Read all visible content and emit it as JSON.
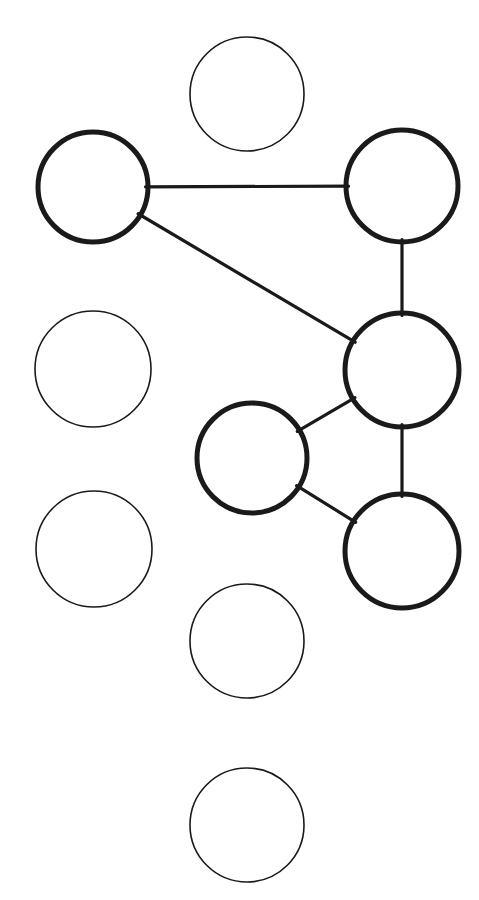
{
  "canvas": {
    "width": 479,
    "height": 900,
    "background_color": "#ffffff",
    "title": "Node Graph Diagram"
  },
  "style": {
    "node_stroke_color": "#1a1a1a",
    "node_fill_color": "#ffffff",
    "edge_stroke_color": "#1a1a1a",
    "selected_stroke_width": 5,
    "unselected_stroke_width": 1.6,
    "edge_stroke_width": 3.2
  },
  "nodes": [
    {
      "id": "n1",
      "label": "",
      "cx": 247,
      "cy": 94,
      "r": 57,
      "state": "unselected",
      "name": "node-top-center"
    },
    {
      "id": "n2",
      "label": "",
      "cx": 93,
      "cy": 187,
      "r": 55,
      "state": "selected",
      "name": "node-upper-left"
    },
    {
      "id": "n3",
      "label": "",
      "cx": 402,
      "cy": 186,
      "r": 56,
      "state": "selected",
      "name": "node-upper-right"
    },
    {
      "id": "n4",
      "label": "",
      "cx": 93,
      "cy": 369,
      "r": 58,
      "state": "unselected",
      "name": "node-mid-left"
    },
    {
      "id": "n5",
      "label": "",
      "cx": 402,
      "cy": 370,
      "r": 57,
      "state": "selected",
      "name": "node-mid-right"
    },
    {
      "id": "n6",
      "label": "",
      "cx": 252,
      "cy": 458,
      "r": 55,
      "state": "selected",
      "name": "node-center"
    },
    {
      "id": "n7",
      "label": "",
      "cx": 94,
      "cy": 549,
      "r": 58,
      "state": "unselected",
      "name": "node-lower-left"
    },
    {
      "id": "n8",
      "label": "",
      "cx": 402,
      "cy": 551,
      "r": 57,
      "state": "selected",
      "name": "node-lower-right"
    },
    {
      "id": "n9",
      "label": "",
      "cx": 247,
      "cy": 641,
      "r": 57,
      "state": "unselected",
      "name": "node-lower-center"
    },
    {
      "id": "n10",
      "label": "",
      "cx": 247,
      "cy": 825,
      "r": 57,
      "state": "unselected",
      "name": "node-bottom-center"
    }
  ],
  "edges": [
    {
      "id": "e1",
      "from": "n2",
      "to": "n3",
      "name": "edge-upper-left-to-upper-right"
    },
    {
      "id": "e2",
      "from": "n2",
      "to": "n5",
      "name": "edge-upper-left-to-mid-right"
    },
    {
      "id": "e3",
      "from": "n3",
      "to": "n5",
      "name": "edge-upper-right-to-mid-right"
    },
    {
      "id": "e4",
      "from": "n5",
      "to": "n6",
      "name": "edge-mid-right-to-center"
    },
    {
      "id": "e5",
      "from": "n5",
      "to": "n8",
      "name": "edge-mid-right-to-lower-right"
    },
    {
      "id": "e6",
      "from": "n6",
      "to": "n8",
      "name": "edge-center-to-lower-right"
    }
  ],
  "summary": {
    "node_count": 10,
    "edge_count": 6,
    "selected_count": 5,
    "unselected_count": 5
  }
}
